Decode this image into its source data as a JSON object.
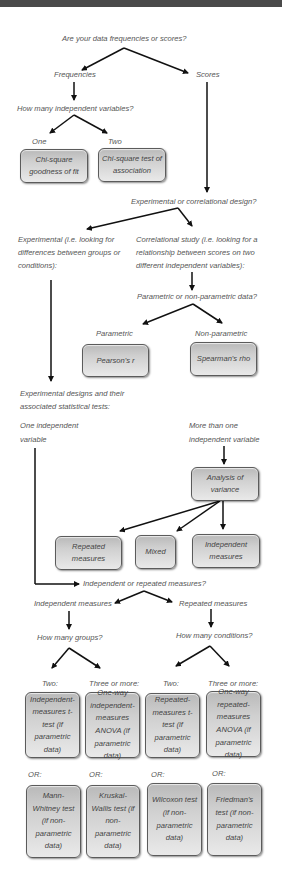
{
  "q_root": "Are your data frequencies or scores?",
  "frequencies": "Frequencies",
  "scores": "Scores",
  "q_ivs": "How many independent variables?",
  "one": "One",
  "two": "Two",
  "chi_gof": "Chi-square goodness of fit",
  "chi_assoc": "Chi-square test of association",
  "q_design": "Experimental or correlational design?",
  "experimental": "Experimental (i.e. looking for differences between groups or conditions):",
  "correlational": "Correlational study (i.e. looking for a relationship between scores on two different independent variables):",
  "q_param": "Parametric or non-parametric data?",
  "parametric": "Parametric",
  "nonparametric": "Non-parametric",
  "pearson": "Pearson's r",
  "spearman": "Spearman's rho",
  "exp_designs": "Experimental designs and their associated statistical tests:",
  "one_iv": "One independent variable",
  "more_iv": "More than one independent variable",
  "anova": "Analysis of variance",
  "anova_repeated": "Repeated measures",
  "anova_mixed": "Mixed",
  "anova_independent": "Independent measures",
  "q_indrep": "Independent or repeated measures?",
  "independent_measures": "Independent measures",
  "repeated_measures": "Repeated measures",
  "q_groups": "How many groups?",
  "q_conditions": "How many conditions?",
  "two_a": "Two:",
  "three_a": "Three or more:",
  "two_b": "Two:",
  "three_b": "Three or more:",
  "t_ind": "Independent-measures t-test (if parametric data)",
  "anova_ind": "One-way independent-measures ANOVA (if parametric data)",
  "t_rep": "Repeated-measures t-test (if parametric data)",
  "anova_rep": "One-way repeated-measures ANOVA (if parametric data)",
  "or1": "OR:",
  "or2": "OR:",
  "or3": "OR:",
  "or4": "OR:",
  "mann": "Mann-Whitney test (if non-parametric data)",
  "kruskal": "Kruskal-Wallis test (if non-parametric data)",
  "wilcoxon": "Wilcoxon test (if non-parametric data)",
  "friedman": "Friedman's test (if non-parametric data)"
}
